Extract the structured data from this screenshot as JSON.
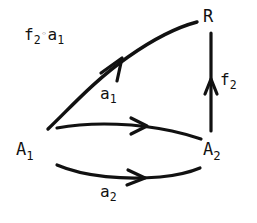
{
  "figure": {
    "kind": "commutative-diagram",
    "width": 257,
    "height": 223,
    "background_color": "#ffffff",
    "ink_color": "#111111"
  },
  "nodes": [
    {
      "id": "A1",
      "label_plain": "A",
      "subscript": "1",
      "x": 16,
      "y": 141
    },
    {
      "id": "A2",
      "label_plain": "A",
      "subscript": "2",
      "x": 203,
      "y": 141
    },
    {
      "id": "R",
      "label_plain": "R",
      "subscript": "",
      "x": 203,
      "y": 8
    }
  ],
  "edges": [
    {
      "id": "a1",
      "label_plain": "a",
      "subscript": "1",
      "from": "A1",
      "to": "A2",
      "shape": "curve-arcs-up",
      "arrowhead": "mid"
    },
    {
      "id": "a2",
      "label_plain": "a",
      "subscript": "2",
      "from": "A1",
      "to": "A2",
      "shape": "curve-sags-down",
      "arrowhead": "mid"
    },
    {
      "id": "f2",
      "label_plain": "f",
      "subscript": "2",
      "from": "A2",
      "to": "R",
      "shape": "straight-vertical-up",
      "arrowhead": "mid"
    },
    {
      "id": "comp",
      "label_prefix": "f",
      "label_prefix_sub": "2",
      "label_operator": "◦",
      "label_suffix": "a",
      "label_suffix_sub": "1",
      "from": "A1",
      "to": "R",
      "shape": "curve-diagonal-up",
      "arrowhead": "mid"
    }
  ],
  "labels": {
    "A1": {
      "base": "A",
      "sub": "1"
    },
    "A2": {
      "base": "A",
      "sub": "2"
    },
    "R": {
      "base": "R",
      "sub": ""
    },
    "a1": {
      "base": "a",
      "sub": "1"
    },
    "a2": {
      "base": "a",
      "sub": "2"
    },
    "f2": {
      "base": "f",
      "sub": "2"
    },
    "comp": {
      "base": "f",
      "sub": "2",
      "op": "◦",
      "base2": "a",
      "sub2": "1"
    }
  }
}
